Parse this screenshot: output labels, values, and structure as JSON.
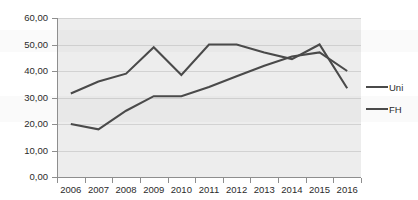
{
  "chart_data": {
    "type": "line",
    "title": "",
    "xlabel": "",
    "ylabel": "",
    "x": [
      "2006",
      "2007",
      "2008",
      "2009",
      "2010",
      "2011",
      "2012",
      "2013",
      "2014",
      "2015",
      "2016"
    ],
    "categories": [
      "2006",
      "2007",
      "2008",
      "2009",
      "2010",
      "2011",
      "2012",
      "2013",
      "2014",
      "2015",
      "2016"
    ],
    "series": [
      {
        "name": "Uni",
        "values": [
          20.0,
          18.0,
          25.0,
          30.5,
          30.5,
          34.0,
          38.0,
          42.0,
          45.5,
          47.0,
          40.0
        ],
        "color": "#4a4a4a"
      },
      {
        "name": "FH",
        "values": [
          31.5,
          36.0,
          39.0,
          49.0,
          38.5,
          50.0,
          50.0,
          47.0,
          44.5,
          50.0,
          33.5
        ],
        "color": "#4a4a4a"
      }
    ],
    "ylim": [
      0,
      60
    ],
    "ytick_values": [
      0,
      10,
      20,
      30,
      40,
      50,
      60
    ],
    "ytick_labels": [
      "0,00",
      "10,00",
      "20,00",
      "30,00",
      "40,00",
      "50,00",
      "60,00"
    ],
    "grid": true,
    "grid_axis": "y",
    "legend_position": "right",
    "legend": [
      "Uni",
      "FH"
    ],
    "plot_background": "#ededed",
    "gridline_color": "#d2d2d2",
    "axis_color": "#8e8e8e",
    "text_color": "#2b2b2b"
  }
}
